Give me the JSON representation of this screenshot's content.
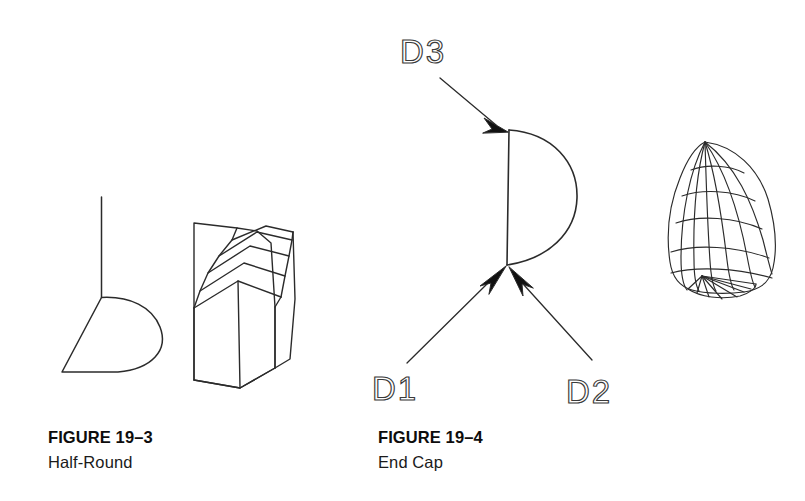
{
  "page": {
    "background_color": "#ffffff",
    "ink_color": "#1a1a1a",
    "width": 805,
    "height": 501
  },
  "figures": [
    {
      "id": "figure-19-3",
      "number": "FIGURE 19–3",
      "title": "Half-Round",
      "parts": [
        {
          "name": "half-round-profile",
          "description": "half-round cross-section profile with vertical extrusion axis line"
        },
        {
          "name": "half-round-solid",
          "description": "isometric extruded solid with faceted half-round top"
        }
      ]
    },
    {
      "id": "figure-19-4",
      "number": "FIGURE 19–4",
      "title": "End Cap",
      "parts": [
        {
          "name": "end-cap-profile",
          "description": "D-shaped profile: straight vertical edge with semicircular arc"
        },
        {
          "name": "end-cap-mesh",
          "description": "wireframe dome / end cap surface mesh"
        }
      ],
      "callouts": [
        {
          "id": "d1",
          "label": "D1",
          "target": "lower-vertex"
        },
        {
          "id": "d2",
          "label": "D2",
          "target": "lower-vertex"
        },
        {
          "id": "d3",
          "label": "D3",
          "target": "upper-vertex"
        }
      ]
    }
  ],
  "colors": {
    "ink": "#1a1a1a",
    "line": "#2b2b2b",
    "callout_text": "#3a3a3a",
    "background": "#ffffff"
  }
}
